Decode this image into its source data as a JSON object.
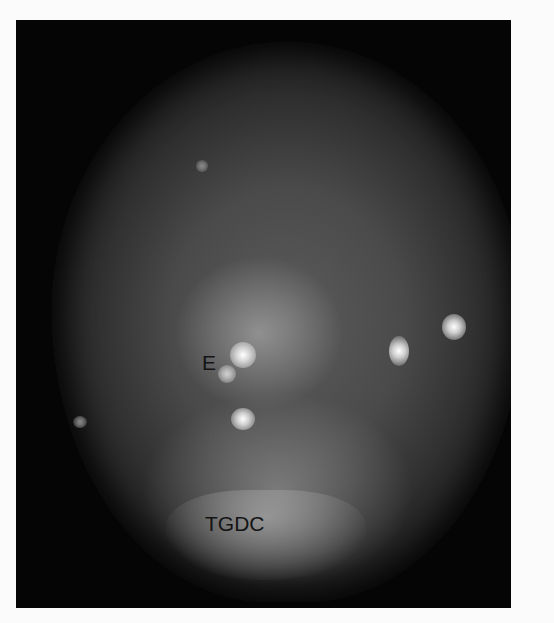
{
  "image": {
    "description": "Grayscale fluorescence endoscopic image in a black rectangular frame with a circular field of view",
    "labels": [
      {
        "id": "E",
        "text": "E"
      },
      {
        "id": "TGDC",
        "text": "TGDC"
      }
    ],
    "colors": {
      "background": "#fbfbfb",
      "frame": "#050505",
      "label": "#141414"
    }
  }
}
